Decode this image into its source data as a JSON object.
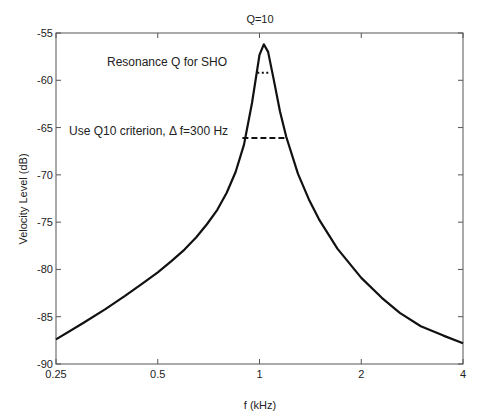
{
  "chart_data": {
    "type": "line",
    "title": "Q=10",
    "xlabel": "f (kHz)",
    "ylabel": "Velocity Level (dB)",
    "xscale": "log2",
    "xlim": [
      0.25,
      4
    ],
    "ylim": [
      -90,
      -55
    ],
    "xticks": [
      0.25,
      0.5,
      1,
      2,
      4
    ],
    "xtick_labels": [
      "0.25",
      "0.5",
      "1",
      "2",
      "4"
    ],
    "yticks": [
      -90,
      -85,
      -80,
      -75,
      -70,
      -65,
      -60,
      -55
    ],
    "ytick_labels": [
      "-90",
      "-85",
      "-80",
      "-75",
      "-70",
      "-65",
      "-60",
      "-55"
    ],
    "grid": false,
    "legend": null,
    "series": [
      {
        "name": "SHO velocity response",
        "style": "solid",
        "x": [
          0.25,
          0.3,
          0.35,
          0.4,
          0.45,
          0.5,
          0.55,
          0.6,
          0.65,
          0.7,
          0.75,
          0.8,
          0.85,
          0.9,
          0.95,
          1.0,
          1.03,
          1.06,
          1.1,
          1.15,
          1.2,
          1.3,
          1.4,
          1.5,
          1.7,
          2.0,
          2.3,
          2.6,
          3.0,
          3.5,
          4.0
        ],
        "y": [
          -87.4,
          -85.7,
          -84.2,
          -82.8,
          -81.5,
          -80.3,
          -79.1,
          -77.9,
          -76.6,
          -75.2,
          -73.7,
          -71.9,
          -69.7,
          -66.8,
          -62.4,
          -57.3,
          -56.2,
          -57.0,
          -59.8,
          -63.3,
          -66.0,
          -69.9,
          -72.6,
          -74.7,
          -77.8,
          -80.9,
          -83.0,
          -84.6,
          -86.0,
          -87.0,
          -87.8
        ]
      }
    ],
    "annotations": [
      {
        "text": "Resonance Q for SHO",
        "x": 0.52,
        "y": -58.3
      },
      {
        "text": "Use Q10 criterion, Δ f=300 Hz",
        "x": 0.265,
        "y": -65.2
      },
      {
        "type": "dotted-hline",
        "x0": 0.985,
        "x1": 1.075,
        "y": -59.2,
        "label": "half-power width"
      },
      {
        "type": "dashed-hline",
        "x0": 0.89,
        "x1": 1.21,
        "y": -66.1,
        "label": "Q10 width (300 Hz)"
      }
    ]
  }
}
